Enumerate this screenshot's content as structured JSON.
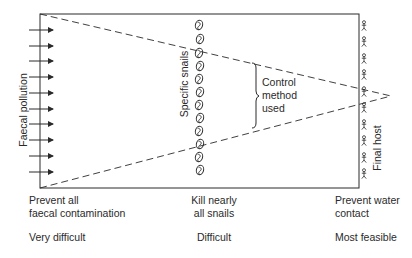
{
  "diagram": {
    "left_label": "Faecal pollution",
    "middle_label": "Specific snails",
    "right_label": "Final host",
    "control_label_lines": [
      "Control",
      "method",
      "used"
    ],
    "arrow_count": 10,
    "snail_count": 12,
    "host_count": 10,
    "colors": {
      "stroke": "#2a2a2a",
      "background": "#ffffff"
    }
  },
  "columns": [
    {
      "action_lines": [
        "Prevent all",
        "faecal contamination"
      ],
      "difficulty": "Very difficult"
    },
    {
      "action_lines": [
        "Kill nearly",
        "all snails"
      ],
      "difficulty": "Difficult"
    },
    {
      "action_lines": [
        "Prevent water",
        "contact"
      ],
      "difficulty": "Most feasible"
    }
  ]
}
